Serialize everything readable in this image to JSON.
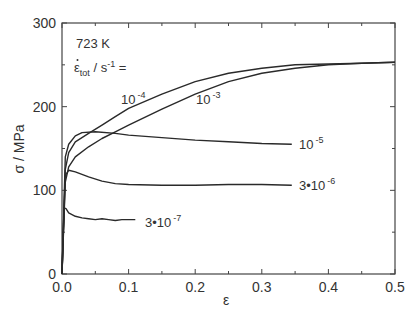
{
  "chart_data": {
    "type": "line",
    "title": "",
    "xlabel": "ε",
    "ylabel": "σ / MPa",
    "xlim": [
      0.0,
      0.5
    ],
    "ylim": [
      0,
      300
    ],
    "x_ticks": [
      "0.0",
      "0.1",
      "0.2",
      "0.3",
      "0.4",
      "0.5"
    ],
    "y_ticks": [
      "0",
      "100",
      "200",
      "300"
    ],
    "grid": false,
    "legend": "inline labels",
    "annotations": {
      "temperature": "723 K",
      "rate_label_main": "ε",
      "rate_label_sub": "tot",
      "rate_label_rest": " / s",
      "rate_label_exp": "-1",
      "rate_label_eq": " ="
    },
    "series": [
      {
        "name": "1e-3",
        "label_base": "10",
        "label_exp": "-3",
        "x": [
          0.0,
          0.005,
          0.01,
          0.02,
          0.04,
          0.06,
          0.08,
          0.1,
          0.15,
          0.2,
          0.25,
          0.3,
          0.35,
          0.4,
          0.45,
          0.5
        ],
        "y": [
          0,
          110,
          128,
          140,
          152,
          162,
          170,
          178,
          197,
          215,
          230,
          240,
          246,
          250,
          252,
          253
        ]
      },
      {
        "name": "1e-4",
        "label_base": "10",
        "label_exp": "-4",
        "x": [
          0.0,
          0.005,
          0.01,
          0.02,
          0.04,
          0.06,
          0.08,
          0.1,
          0.15,
          0.2,
          0.25,
          0.3,
          0.35,
          0.4,
          0.45,
          0.5
        ],
        "y": [
          0,
          125,
          145,
          158,
          168,
          178,
          188,
          198,
          215,
          230,
          240,
          246,
          250,
          251,
          252,
          253
        ]
      },
      {
        "name": "1e-5",
        "label_base": "10",
        "label_exp": "-5",
        "x": [
          0.0,
          0.005,
          0.01,
          0.02,
          0.03,
          0.05,
          0.08,
          0.1,
          0.15,
          0.2,
          0.25,
          0.3,
          0.345
        ],
        "y": [
          0,
          140,
          155,
          165,
          169,
          170,
          168,
          166,
          163,
          160,
          158,
          156,
          155
        ]
      },
      {
        "name": "3e-6",
        "label_base": "3•10",
        "label_exp": "-6",
        "x": [
          0.0,
          0.005,
          0.01,
          0.02,
          0.04,
          0.06,
          0.08,
          0.1,
          0.15,
          0.2,
          0.25,
          0.3,
          0.345
        ],
        "y": [
          0,
          118,
          124,
          122,
          116,
          111,
          108,
          107,
          106,
          106,
          107,
          107,
          106
        ]
      },
      {
        "name": "3e-7",
        "label_base": "3•10",
        "label_exp": "-7",
        "x": [
          0.0,
          0.003,
          0.006,
          0.01,
          0.02,
          0.03,
          0.04,
          0.05,
          0.06,
          0.07,
          0.08,
          0.09,
          0.1,
          0.11
        ],
        "y": [
          0,
          79,
          78,
          73,
          69,
          67,
          66,
          65,
          66,
          65,
          64,
          65,
          65,
          65
        ]
      }
    ]
  }
}
